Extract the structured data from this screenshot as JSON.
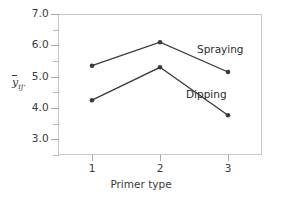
{
  "chart_data": {
    "type": "line",
    "title": "",
    "xlabel": "Primer type",
    "ylabel": "ȳij·",
    "categories": [
      "1",
      "2",
      "3"
    ],
    "x": [
      1,
      2,
      3
    ],
    "xlim": [
      0.5,
      3.5
    ],
    "ylim": [
      2.5,
      7.0
    ],
    "yticks": [
      "3.0",
      "4.0",
      "5.0",
      "6.0",
      "7.0"
    ],
    "ytick_values": [
      3.0,
      4.0,
      5.0,
      6.0,
      7.0
    ],
    "yminor_values": [
      2.5,
      3.5,
      4.5,
      5.5,
      6.5
    ],
    "grid": false,
    "legend_position": "inline-right",
    "marker": "filled-circle",
    "line_color": "#3a3a3a",
    "series": [
      {
        "name": "Spraying",
        "values": [
          5.35,
          6.1,
          5.15
        ],
        "label_x": 3,
        "color": "#3a3a3a"
      },
      {
        "name": "Dipping",
        "values": [
          4.25,
          5.3,
          3.77
        ],
        "label_x": 3,
        "color": "#3a3a3a"
      }
    ]
  },
  "axes": {
    "y_title_main": "y",
    "y_title_sub": "ij",
    "y_title_dot": "·",
    "x_title": "Primer type"
  },
  "colors": {
    "frame": "#c9c9c9",
    "tick": "#a8a8a8",
    "text": "#3a3a3a",
    "series": "#3a3a3a",
    "background": "#ffffff"
  }
}
